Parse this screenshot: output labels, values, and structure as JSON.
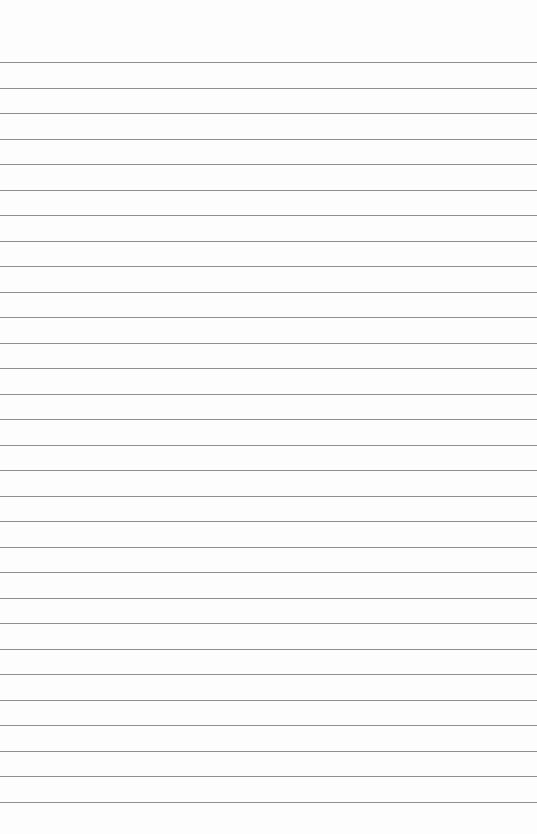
{
  "paper": {
    "type": "lined-paper",
    "background_color": "#fdfdfd",
    "line_color": "#8e8e8e",
    "line_count": 30,
    "first_line_y": 62,
    "line_spacing": 25.5
  }
}
